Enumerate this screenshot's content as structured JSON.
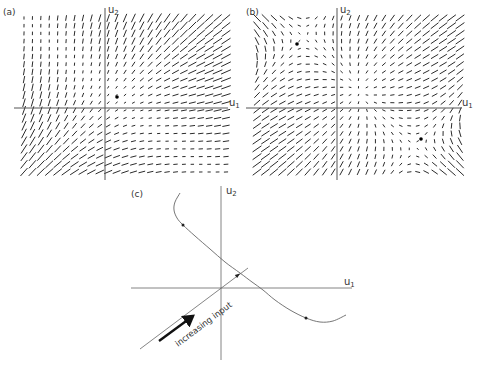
{
  "figure": {
    "ink_color": "#2b2b2b",
    "axis_color": "#555555",
    "curve_color": "#666666"
  },
  "panels": [
    {
      "id": "a",
      "label": "(a)",
      "axis_u1": {
        "label": "u",
        "sub": "1"
      },
      "axis_u2": {
        "label": "u",
        "sub": "2"
      },
      "frame": {
        "x0": 24,
        "x1": 226,
        "y0": 18,
        "y1": 172
      },
      "grid": {
        "cols": 25,
        "rows": 21
      },
      "axes": {
        "origin_x": 105,
        "origin_y": 108,
        "h_x0": 14,
        "h_x1": 228,
        "v_y0": 8,
        "v_y1": 180
      },
      "fixed_points": [
        {
          "x": 117,
          "y": 97
        }
      ],
      "field_model": {
        "type": "single-well",
        "note": "visual approximation of slope-field orientation and length"
      }
    },
    {
      "id": "b",
      "label": "(b)",
      "axis_u1": {
        "label": "u",
        "sub": "1"
      },
      "axis_u2": {
        "label": "u",
        "sub": "2"
      },
      "frame": {
        "x0": 257,
        "x1": 460,
        "y0": 18,
        "y1": 172
      },
      "grid": {
        "cols": 25,
        "rows": 21
      },
      "axes": {
        "origin_x": 337,
        "origin_y": 108,
        "h_x0": 246,
        "h_x1": 462,
        "v_y0": 8,
        "v_y1": 180
      },
      "fixed_points": [
        {
          "x": 297,
          "y": 44
        },
        {
          "x": 421,
          "y": 139
        }
      ],
      "field_model": {
        "type": "bistable",
        "note": "visual approximation of slope-field orientation and length"
      }
    },
    {
      "id": "c",
      "label": "(c)",
      "axis_u1": {
        "label": "u",
        "sub": "1"
      },
      "axis_u2": {
        "label": "u",
        "sub": "2"
      },
      "axes": {
        "origin_x": 221,
        "origin_y": 288,
        "h_x0": 131,
        "h_x1": 352,
        "v_y0": 186,
        "v_y1": 360
      },
      "curve_points": [
        [
          180,
          193
        ],
        [
          175,
          202
        ],
        [
          174,
          210
        ],
        [
          177,
          218
        ],
        [
          183,
          225
        ],
        [
          195,
          236
        ],
        [
          210,
          249
        ],
        [
          225,
          262
        ],
        [
          240,
          273
        ],
        [
          252,
          282
        ],
        [
          263,
          290
        ],
        [
          275,
          300
        ],
        [
          290,
          310
        ],
        [
          306,
          318
        ],
        [
          320,
          322
        ],
        [
          333,
          321
        ],
        [
          346,
          315
        ]
      ],
      "curve_markers": [
        {
          "x": 183,
          "y": 225
        },
        {
          "x": 306,
          "y": 318
        }
      ],
      "input_line": {
        "x0": 140,
        "y0": 349,
        "x1": 248,
        "y1": 268
      },
      "input_line_marker": {
        "x": 238,
        "y": 275
      },
      "input_arrow": {
        "x0": 159,
        "y0": 341,
        "x1": 193,
        "y1": 316
      },
      "input_label": {
        "text": "increasing input",
        "x": 178,
        "y": 347,
        "angle": -37
      }
    }
  ]
}
